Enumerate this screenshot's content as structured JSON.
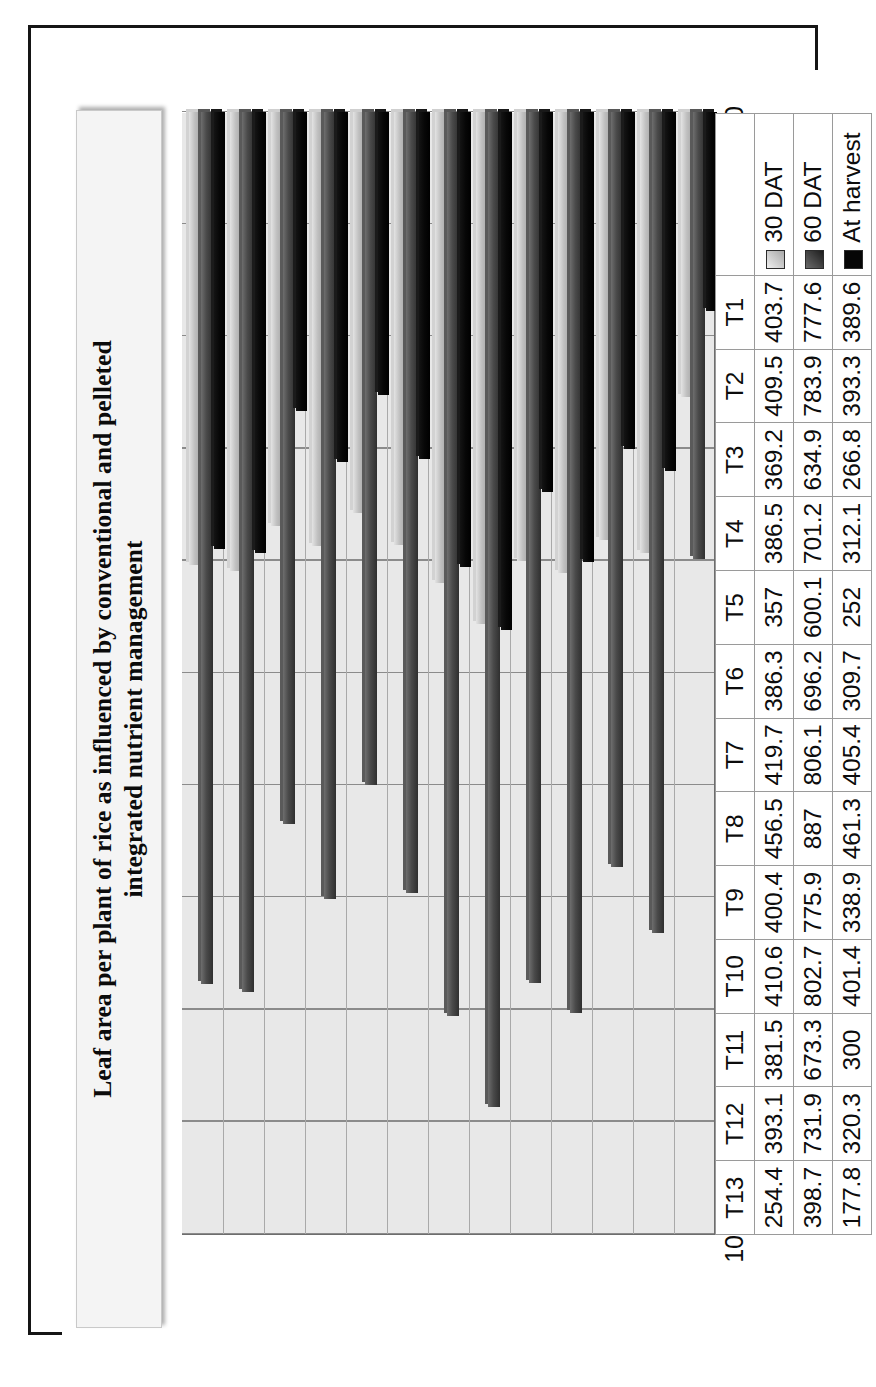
{
  "chart_data": {
    "type": "bar",
    "orientation": "vertical-clustered-3d",
    "title": "Leaf area per plant of rice as influenced by conventional and pelleted integrated nutrient management",
    "title_line1": "Leaf area per plant of rice as influenced by conventional and pelleted",
    "title_line2": "integrated nutrient management",
    "xlabel": "",
    "ylabel": "Leaf area plant per plant cm²",
    "ylim": [
      0,
      1000
    ],
    "ytick_step": 100,
    "yticks": [
      "0",
      "100",
      "200",
      "300",
      "400",
      "500",
      "600",
      "700",
      "800",
      "900",
      "1000"
    ],
    "grid": true,
    "legend_position": "data-table-row-headers",
    "categories": [
      "T1",
      "T2",
      "T3",
      "T4",
      "T5",
      "T6",
      "T7",
      "T8",
      "T9",
      "T10",
      "T11",
      "T12",
      "T13"
    ],
    "series": [
      {
        "name": "30 DAT",
        "color": "#bfbfbf",
        "values": [
          403.7,
          409.5,
          369.2,
          386.5,
          357,
          386.3,
          419.7,
          456.5,
          400.4,
          410.6,
          381.5,
          393.1,
          254.4
        ],
        "labels": [
          "403.7",
          "409.5",
          "369.2",
          "386.5",
          "357",
          "386.3",
          "419.7",
          "456.5",
          "400.4",
          "410.6",
          "381.5",
          "393.1",
          "254.4"
        ]
      },
      {
        "name": "60 DAT",
        "color": "#4a4a4a",
        "values": [
          777.6,
          783.9,
          634.9,
          701.2,
          600.1,
          696.2,
          806.1,
          887,
          775.9,
          802.7,
          673.3,
          731.9,
          398.7
        ],
        "labels": [
          "777.6",
          "783.9",
          "634.9",
          "701.2",
          "600.1",
          "696.2",
          "806.1",
          "887",
          "775.9",
          "802.7",
          "673.3",
          "731.9",
          "398.7"
        ]
      },
      {
        "name": "At harvest",
        "color": "#070707",
        "values": [
          389.6,
          393.3,
          266.8,
          312.1,
          252,
          309.7,
          405.4,
          461.3,
          338.9,
          401.4,
          300,
          320.3,
          177.8
        ],
        "labels": [
          "389.6",
          "393.3",
          "266.8",
          "312.1",
          "252",
          "309.7",
          "405.4",
          "461.3",
          "338.9",
          "401.4",
          "300",
          "320.3",
          "177.8"
        ]
      }
    ]
  },
  "table": {
    "corner_label": "",
    "row_headers": [
      "30 DAT",
      "60 DAT",
      "At harvest"
    ],
    "column_headers": [
      "T1",
      "T2",
      "T3",
      "T4",
      "T5",
      "T6",
      "T7",
      "T8",
      "T9",
      "T10",
      "T11",
      "T12",
      "T13"
    ],
    "rows": [
      [
        "403.7",
        "409.5",
        "369.2",
        "386.5",
        "357",
        "386.3",
        "419.7",
        "456.5",
        "400.4",
        "410.6",
        "381.5",
        "393.1",
        "254.4"
      ],
      [
        "777.6",
        "783.9",
        "634.9",
        "701.2",
        "600.1",
        "696.2",
        "806.1",
        "887",
        "775.9",
        "802.7",
        "673.3",
        "731.9",
        "398.7"
      ],
      [
        "389.6",
        "393.3",
        "266.8",
        "312.1",
        "252",
        "309.7",
        "405.4",
        "461.3",
        "338.9",
        "401.4",
        "300",
        "320.3",
        "177.8"
      ]
    ]
  },
  "legend": {
    "items": [
      {
        "label": "30 DAT",
        "swatch": "light-gray-swatch-icon"
      },
      {
        "label": "60 DAT",
        "swatch": "dark-gray-swatch-icon"
      },
      {
        "label": "At harvest",
        "swatch": "black-swatch-icon"
      }
    ]
  }
}
